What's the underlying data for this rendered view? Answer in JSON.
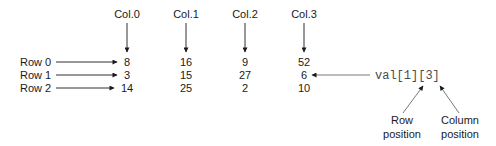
{
  "diagram": {
    "column_labels": [
      "Col.0",
      "Col.1",
      "Col.2",
      "Col.3"
    ],
    "row_labels": [
      "Row 0",
      "Row 1",
      "Row 2"
    ],
    "values": [
      [
        "8",
        "16",
        "9",
        "52"
      ],
      [
        "3",
        "15",
        "27",
        "6"
      ],
      [
        "14",
        "25",
        "2",
        "10"
      ]
    ],
    "expression": {
      "text": "val[1][3]",
      "points_to": {
        "row": 1,
        "col": 3
      }
    },
    "annotations": {
      "row_position": [
        "Row",
        "position"
      ],
      "column_position": [
        "Column",
        "position"
      ]
    }
  }
}
